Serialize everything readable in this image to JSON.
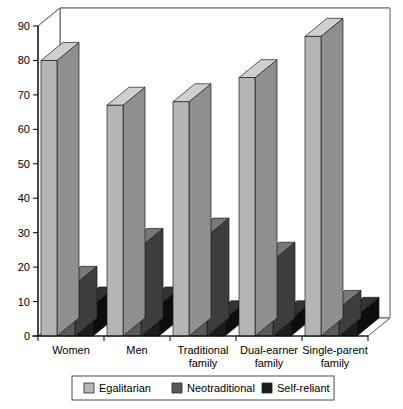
{
  "chart_data": {
    "type": "bar",
    "title": "",
    "xlabel": "",
    "ylabel": "",
    "ylim": [
      0,
      90
    ],
    "ytick_step": 10,
    "yticks": [
      "0",
      "10",
      "20",
      "30",
      "40",
      "50",
      "60",
      "70",
      "80",
      "90"
    ],
    "grid": true,
    "three_d": true,
    "legend_position": "bottom",
    "categories": [
      "Women",
      "Men",
      "Traditional family",
      "Dual-earner family",
      "Single-parent family"
    ],
    "category_lines": [
      [
        "Women"
      ],
      [
        "Men"
      ],
      [
        "Traditional",
        "family"
      ],
      [
        "Dual-earner",
        "family"
      ],
      [
        "Single-parent",
        "family"
      ]
    ],
    "series": [
      {
        "name": "Egalitarian",
        "color": "#b5b5b5",
        "side_color": "#8f8f8f",
        "top_color": "#cfcfcf",
        "values": [
          80,
          67,
          68,
          75,
          87
        ]
      },
      {
        "name": "Neotraditional",
        "color": "#595959",
        "side_color": "#3d3d3d",
        "top_color": "#787878",
        "values": [
          15,
          26,
          29,
          22,
          8
        ]
      },
      {
        "name": "Self-reliant",
        "color": "#1c1c1c",
        "side_color": "#0d0d0d",
        "top_color": "#333333",
        "values": [
          9,
          9,
          5,
          5,
          6
        ]
      }
    ]
  },
  "legend": {
    "items": [
      {
        "label": "Egalitarian",
        "color": "#b5b5b5"
      },
      {
        "label": "Neotraditional",
        "color": "#595959"
      },
      {
        "label": "Self-reliant",
        "color": "#1c1c1c"
      }
    ]
  },
  "axis": {
    "y_min_label": "0",
    "y_max_label": "90"
  },
  "colors": {
    "frame": "#5a5a5a",
    "grid": "#8a8a8a",
    "background": "#ffffff",
    "text": "#000000"
  }
}
